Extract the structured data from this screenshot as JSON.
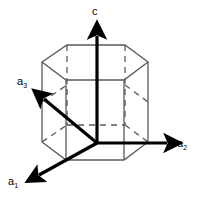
{
  "figure": {
    "width": 199,
    "height": 200,
    "background_color": "#ffffff"
  },
  "colors": {
    "axis_stroke": "#000000",
    "solid_edge": "#5a5a5a",
    "hidden_edge": "#5a5a5a",
    "label_text": "#000000"
  },
  "axes": [
    {
      "id": "c",
      "label": "c",
      "subscript": "",
      "direction": "up",
      "origin": [
        97,
        143
      ],
      "tip": [
        97,
        29
      ]
    },
    {
      "id": "a3",
      "label": "a",
      "subscript": "3",
      "direction": "upper-left",
      "origin": [
        97,
        143
      ],
      "tip": [
        36,
        92
      ]
    },
    {
      "id": "a1",
      "label": "a",
      "subscript": "1",
      "direction": "lower-left",
      "origin": [
        97,
        143
      ],
      "tip": [
        31,
        181
      ]
    },
    {
      "id": "a2",
      "label": "a",
      "subscript": "2",
      "direction": "right",
      "origin": [
        97,
        143
      ],
      "tip": [
        175,
        143
      ]
    }
  ],
  "prism": {
    "shape": "hexagonal-prism",
    "top_face_vertices": [
      [
        42,
        62
      ],
      [
        67,
        45
      ],
      [
        125,
        45
      ],
      [
        148,
        62
      ],
      [
        124,
        80
      ],
      [
        66,
        80
      ]
    ],
    "bottom_face_vertices": [
      [
        42,
        142
      ],
      [
        67,
        125
      ],
      [
        125,
        125
      ],
      [
        148,
        142
      ],
      [
        124,
        160
      ],
      [
        66,
        160
      ]
    ],
    "vertical_edges": 6,
    "hidden_edge_style": "dashed"
  }
}
